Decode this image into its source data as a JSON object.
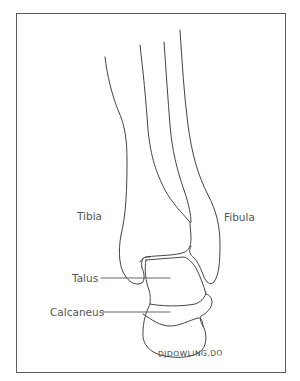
{
  "figure": {
    "labels": {
      "tibia": "Tibia",
      "fibula": "Fibula",
      "talus": "Talus",
      "calcaneus": "Calcaneus"
    },
    "signature": "DJDOWLING,DO",
    "colors": {
      "line": "#444444",
      "frame": "#5a5a5a",
      "label_text": "#555555",
      "background": "#ffffff"
    }
  }
}
